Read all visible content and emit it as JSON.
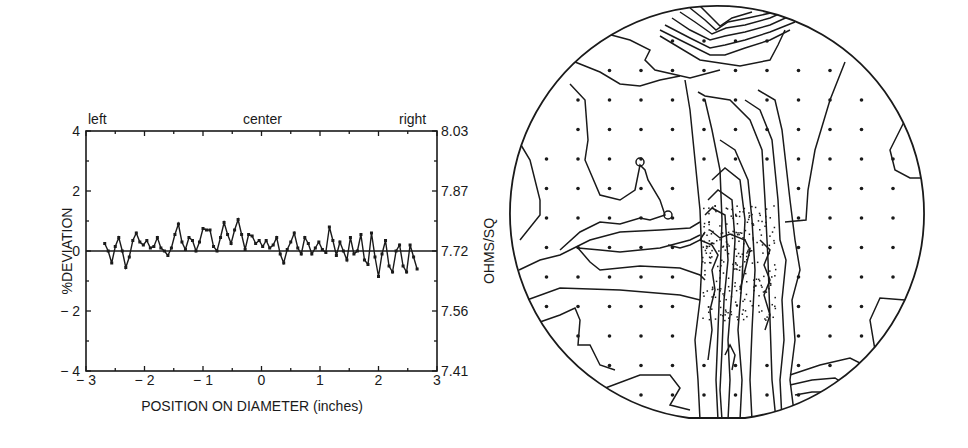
{
  "chart_data": [
    {
      "type": "line",
      "title": "",
      "top_labels": {
        "left": "left",
        "center": "center",
        "right": "right"
      },
      "xlabel": "POSITION ON DIAMETER (inches)",
      "ylabel": "%DEVIATION",
      "y2label": "OHMS/SQ",
      "xlim": [
        -3,
        3
      ],
      "ylim": [
        -4,
        4
      ],
      "y2lim": [
        7.41,
        8.03
      ],
      "x_ticks": [
        "-3",
        "-2",
        "-1",
        "0",
        "1",
        "2",
        "3"
      ],
      "y_ticks": [
        "4",
        "2",
        "0",
        "-2",
        "-4"
      ],
      "y2_ticks": [
        "8.03",
        "7.87",
        "7.72",
        "7.56",
        "7.41"
      ],
      "grid": false,
      "reference_line_y": 0,
      "series": [
        {
          "name": "%DEVIATION",
          "marker": "x",
          "x": [
            -2.68,
            -2.62,
            -2.56,
            -2.5,
            -2.44,
            -2.38,
            -2.32,
            -2.26,
            -2.2,
            -2.14,
            -2.08,
            -2.02,
            -1.96,
            -1.9,
            -1.84,
            -1.78,
            -1.72,
            -1.66,
            -1.6,
            -1.54,
            -1.48,
            -1.42,
            -1.36,
            -1.3,
            -1.24,
            -1.18,
            -1.12,
            -1.06,
            -1.0,
            -0.94,
            -0.88,
            -0.82,
            -0.76,
            -0.7,
            -0.64,
            -0.58,
            -0.52,
            -0.46,
            -0.4,
            -0.34,
            -0.28,
            -0.22,
            -0.16,
            -0.1,
            -0.04,
            0.02,
            0.08,
            0.14,
            0.2,
            0.26,
            0.32,
            0.38,
            0.44,
            0.5,
            0.56,
            0.62,
            0.68,
            0.74,
            0.8,
            0.86,
            0.92,
            0.98,
            1.04,
            1.1,
            1.16,
            1.22,
            1.28,
            1.34,
            1.4,
            1.46,
            1.52,
            1.58,
            1.64,
            1.7,
            1.76,
            1.82,
            1.88,
            1.94,
            2.0,
            2.06,
            2.12,
            2.18,
            2.24,
            2.3,
            2.36,
            2.42,
            2.48,
            2.54,
            2.6,
            2.66
          ],
          "values": [
            0.25,
            0.0,
            -0.4,
            0.15,
            0.45,
            0.0,
            -0.55,
            -0.2,
            0.35,
            0.6,
            0.3,
            0.2,
            0.35,
            0.1,
            0.15,
            0.45,
            0.1,
            0.0,
            -0.15,
            0.1,
            0.55,
            0.9,
            0.3,
            0.05,
            0.45,
            0.35,
            0.0,
            0.3,
            0.75,
            0.7,
            0.7,
            0.15,
            0.0,
            0.45,
            0.95,
            0.55,
            0.25,
            0.7,
            1.05,
            0.55,
            0.05,
            0.55,
            0.5,
            0.25,
            0.35,
            0.15,
            0.35,
            0.1,
            0.2,
            0.45,
            -0.1,
            -0.4,
            0.05,
            0.3,
            0.6,
            0.1,
            -0.1,
            0.45,
            0.25,
            -0.1,
            0.1,
            0.3,
            0.05,
            -0.05,
            0.8,
            0.35,
            -0.15,
            0.3,
            0.0,
            -0.3,
            0.45,
            -0.1,
            0.0,
            0.55,
            -0.3,
            -0.45,
            0.6,
            -0.2,
            -0.85,
            -0.1,
            0.35,
            -0.5,
            -0.7,
            0.0,
            0.2,
            -0.5,
            -0.7,
            0.2,
            -0.2,
            -0.6
          ]
        }
      ]
    },
    {
      "type": "heatmap",
      "title": "",
      "description": "Circular wafer sheet-resistance contour map with measurement-point grid",
      "grid_columns": 12,
      "grid_rows": 12,
      "features": [
        "dense vertical band of contours through center",
        "horizontal contour band at left-center",
        "contour cluster at top edge",
        "contour cluster at bottom-right edge"
      ]
    }
  ],
  "labels": {
    "left": "left",
    "center": "center",
    "right": "right",
    "xlabel": "POSITION ON DIAMETER (inches)",
    "ylabel": "%DEVIATION",
    "y2label": "OHMS/SQ"
  }
}
